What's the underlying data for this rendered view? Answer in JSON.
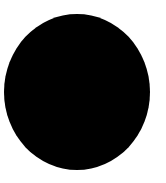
{
  "canvas": {
    "width": 166,
    "height": 183,
    "background_color": "#ffffff",
    "description": "Solid black filled circle on a plain white background"
  },
  "shape": {
    "name": "black-circle",
    "type": "ellipse",
    "fill_color": "#000000",
    "stroke_color": "none",
    "stroke_width": 0,
    "center_x": 77,
    "center_y": 92,
    "radius_x": 73,
    "radius_y": 78,
    "bounds": {
      "left": 4,
      "top": 14,
      "right": 150,
      "bottom": 170,
      "width": 146,
      "height": 156
    }
  }
}
